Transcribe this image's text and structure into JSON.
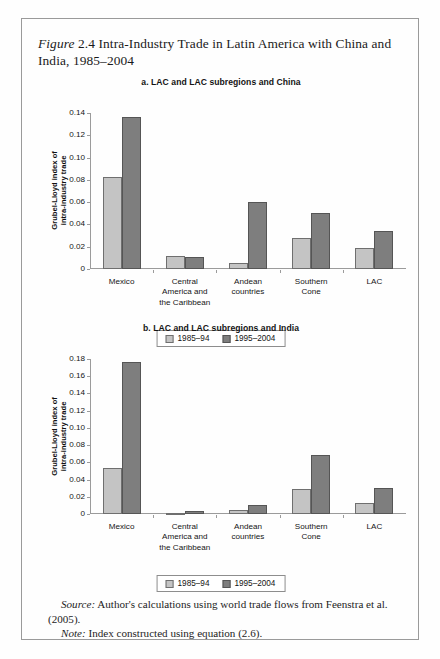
{
  "figure": {
    "label": "Figure",
    "number": "2.4",
    "title": "Intra-Industry Trade in Latin America with China and India, 1985–2004"
  },
  "legend": {
    "series1_label": "1985–94",
    "series2_label": "1995–2004",
    "series1_color": "#c4c4c4",
    "series2_color": "#7e7e7e"
  },
  "notes": {
    "source_label": "Source:",
    "source_text": "Author's calculations using world trade flows from Feenstra et al. (2005).",
    "note_label": "Note:",
    "note_text": "Index constructed using equation (2.6)."
  },
  "chart_data": [
    {
      "type": "bar",
      "id": "panel-a",
      "title": "a. LAC and LAC subregions and China",
      "xlabel": "",
      "ylabel": "Grubel-Lloyd index of intra-industry trade",
      "ylabel_line1": "Grubel-Lloyd index of",
      "ylabel_line2": "intra-industry trade",
      "categories": [
        "Mexico",
        "Central America and the Caribbean",
        "Andean countries",
        "Southern Cone",
        "LAC"
      ],
      "category_lines": [
        [
          "Mexico"
        ],
        [
          "Central",
          "America and",
          "the Caribbean"
        ],
        [
          "Andean",
          "countries"
        ],
        [
          "Southern",
          "Cone"
        ],
        [
          "LAC"
        ]
      ],
      "series": [
        {
          "name": "1985–94",
          "values": [
            0.083,
            0.012,
            0.005,
            0.028,
            0.019
          ]
        },
        {
          "name": "1995–2004",
          "values": [
            0.136,
            0.011,
            0.06,
            0.05,
            0.034
          ]
        }
      ],
      "ylim": [
        0,
        0.14
      ],
      "yticks": [
        0,
        0.02,
        0.04,
        0.06,
        0.08,
        0.1,
        0.12,
        0.14
      ],
      "ytick_labels": [
        "0",
        "0.02",
        "0.04",
        "0.06",
        "0.08",
        "0.10",
        "0.12",
        "0.14"
      ],
      "grid": false,
      "legend_position": "bottom"
    },
    {
      "type": "bar",
      "id": "panel-b",
      "title": "b. LAC and LAC subregions and India",
      "xlabel": "",
      "ylabel": "Grubel-Lloyd index of intra-industry trade",
      "ylabel_line1": "Grubel-Lloyd index of",
      "ylabel_line2": "intra-industry trade",
      "categories": [
        "Mexico",
        "Central America and the Caribbean",
        "Andean countries",
        "Southern Cone",
        "LAC"
      ],
      "category_lines": [
        [
          "Mexico"
        ],
        [
          "Central",
          "America and",
          "the Caribbean"
        ],
        [
          "Andean",
          "countries"
        ],
        [
          "Southern",
          "Cone"
        ],
        [
          "LAC"
        ]
      ],
      "series": [
        {
          "name": "1985–94",
          "values": [
            0.054,
            0.0,
            0.005,
            0.029,
            0.013
          ]
        },
        {
          "name": "1995–2004",
          "values": [
            0.177,
            0.003,
            0.01,
            0.068,
            0.03
          ]
        }
      ],
      "ylim": [
        0,
        0.18
      ],
      "yticks": [
        0,
        0.02,
        0.04,
        0.06,
        0.08,
        0.1,
        0.12,
        0.14,
        0.16,
        0.18
      ],
      "ytick_labels": [
        "0",
        "0.02",
        "0.04",
        "0.06",
        "0.08",
        "0.10",
        "0.12",
        "0.14",
        "0.16",
        "0.18"
      ],
      "grid": false,
      "legend_position": "bottom"
    }
  ]
}
